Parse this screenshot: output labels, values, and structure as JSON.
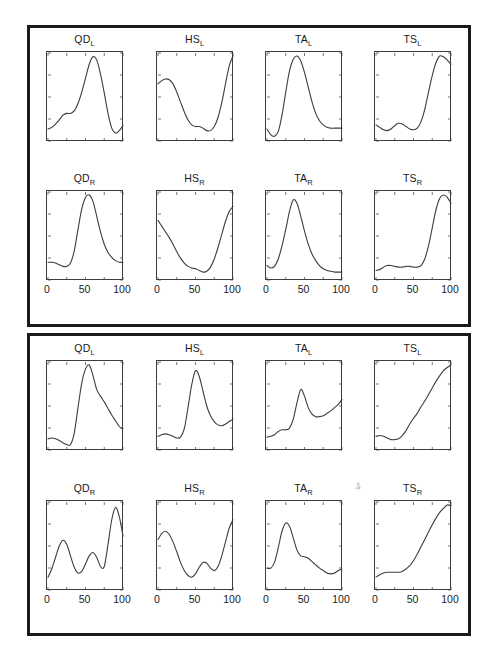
{
  "figure": {
    "background_color": "#ffffff",
    "border_color": "#1a1a1a",
    "curve_color": "#3d3d3d",
    "axis_color": "#3d3d3d",
    "width": 497,
    "height": 665,
    "panel_count": 2,
    "artifact_mark": "4"
  },
  "axis": {
    "x_ticks": [
      "0",
      "50",
      "100"
    ],
    "x_tick_values": [
      0,
      50,
      100
    ],
    "xlim": [
      0,
      100
    ],
    "ylim": [
      0,
      1
    ],
    "grid": false,
    "y_ticks_visible": false
  },
  "chart_data": [
    {
      "type": "line",
      "panel": 1,
      "row": 1,
      "col": 1,
      "title": "QD",
      "subscript": "L",
      "xlabel": "",
      "ylabel": "",
      "xlim": [
        0,
        100
      ],
      "ylim": [
        0,
        1
      ],
      "x": [
        0,
        5,
        10,
        15,
        20,
        25,
        30,
        35,
        40,
        45,
        50,
        55,
        60,
        65,
        70,
        75,
        80,
        85,
        90,
        95,
        100
      ],
      "y": [
        0.11,
        0.13,
        0.17,
        0.22,
        0.28,
        0.3,
        0.3,
        0.33,
        0.42,
        0.56,
        0.73,
        0.9,
        0.99,
        0.95,
        0.78,
        0.55,
        0.3,
        0.12,
        0.06,
        0.09,
        0.15
      ]
    },
    {
      "type": "line",
      "panel": 1,
      "row": 1,
      "col": 2,
      "title": "HS",
      "subscript": "L",
      "xlabel": "",
      "ylabel": "",
      "xlim": [
        0,
        100
      ],
      "ylim": [
        0,
        1
      ],
      "x": [
        0,
        5,
        10,
        15,
        20,
        25,
        30,
        35,
        40,
        45,
        50,
        55,
        60,
        65,
        70,
        75,
        80,
        85,
        90,
        95,
        100
      ],
      "y": [
        0.66,
        0.7,
        0.72,
        0.71,
        0.66,
        0.56,
        0.44,
        0.32,
        0.22,
        0.16,
        0.14,
        0.14,
        0.12,
        0.09,
        0.09,
        0.14,
        0.25,
        0.43,
        0.66,
        0.88,
        1.0
      ]
    },
    {
      "type": "line",
      "panel": 1,
      "row": 1,
      "col": 3,
      "title": "TA",
      "subscript": "L",
      "xlabel": "",
      "ylabel": "",
      "xlim": [
        0,
        100
      ],
      "ylim": [
        0,
        1
      ],
      "x": [
        0,
        5,
        10,
        15,
        20,
        25,
        30,
        35,
        40,
        45,
        50,
        55,
        60,
        65,
        70,
        75,
        80,
        85,
        90,
        95,
        100
      ],
      "y": [
        0.11,
        0.04,
        0.02,
        0.08,
        0.28,
        0.56,
        0.82,
        0.96,
        1.0,
        0.94,
        0.8,
        0.62,
        0.44,
        0.3,
        0.21,
        0.16,
        0.13,
        0.12,
        0.12,
        0.12,
        0.12
      ]
    },
    {
      "type": "line",
      "panel": 1,
      "row": 1,
      "col": 4,
      "title": "TS",
      "subscript": "L",
      "xlabel": "",
      "ylabel": "",
      "xlim": [
        0,
        100
      ],
      "ylim": [
        0,
        1
      ],
      "x": [
        0,
        5,
        10,
        15,
        20,
        25,
        30,
        35,
        40,
        45,
        50,
        55,
        60,
        65,
        70,
        75,
        80,
        85,
        90,
        95,
        100
      ],
      "y": [
        0.16,
        0.13,
        0.1,
        0.09,
        0.11,
        0.15,
        0.18,
        0.17,
        0.14,
        0.11,
        0.1,
        0.12,
        0.2,
        0.35,
        0.56,
        0.76,
        0.92,
        1.0,
        0.99,
        0.95,
        0.9
      ]
    },
    {
      "type": "line",
      "panel": 1,
      "row": 2,
      "col": 1,
      "title": "QD",
      "subscript": "R",
      "xlabel": "",
      "ylabel": "",
      "xlim": [
        0,
        100
      ],
      "ylim": [
        0,
        1
      ],
      "x": [
        0,
        5,
        10,
        15,
        20,
        25,
        30,
        35,
        40,
        45,
        50,
        55,
        60,
        65,
        70,
        75,
        80,
        85,
        90,
        95,
        100
      ],
      "y": [
        0.18,
        0.18,
        0.17,
        0.15,
        0.13,
        0.13,
        0.17,
        0.32,
        0.58,
        0.83,
        0.97,
        1.0,
        0.92,
        0.74,
        0.55,
        0.4,
        0.3,
        0.24,
        0.2,
        0.18,
        0.18
      ]
    },
    {
      "type": "line",
      "panel": 1,
      "row": 2,
      "col": 2,
      "title": "HS",
      "subscript": "R",
      "xlabel": "",
      "ylabel": "",
      "xlim": [
        0,
        100
      ],
      "ylim": [
        0,
        1
      ],
      "x": [
        0,
        5,
        10,
        15,
        20,
        25,
        30,
        35,
        40,
        45,
        50,
        55,
        60,
        65,
        70,
        75,
        80,
        85,
        90,
        95,
        100
      ],
      "y": [
        0.69,
        0.62,
        0.55,
        0.48,
        0.4,
        0.31,
        0.23,
        0.17,
        0.13,
        0.11,
        0.1,
        0.08,
        0.06,
        0.07,
        0.12,
        0.22,
        0.36,
        0.52,
        0.68,
        0.8,
        0.86
      ]
    },
    {
      "type": "line",
      "panel": 1,
      "row": 2,
      "col": 3,
      "title": "TA",
      "subscript": "R",
      "xlabel": "",
      "ylabel": "",
      "xlim": [
        0,
        100
      ],
      "ylim": [
        0,
        1
      ],
      "x": [
        0,
        5,
        10,
        15,
        20,
        25,
        30,
        35,
        40,
        45,
        50,
        55,
        60,
        65,
        70,
        75,
        80,
        85,
        90,
        95,
        100
      ],
      "y": [
        0.14,
        0.11,
        0.13,
        0.22,
        0.38,
        0.58,
        0.8,
        0.94,
        0.9,
        0.74,
        0.56,
        0.4,
        0.28,
        0.2,
        0.14,
        0.1,
        0.08,
        0.07,
        0.06,
        0.06,
        0.06
      ]
    },
    {
      "type": "line",
      "panel": 1,
      "row": 2,
      "col": 4,
      "title": "TS",
      "subscript": "R",
      "xlabel": "",
      "ylabel": "",
      "xlim": [
        0,
        100
      ],
      "ylim": [
        0,
        1
      ],
      "x": [
        0,
        5,
        10,
        15,
        20,
        25,
        30,
        35,
        40,
        45,
        50,
        55,
        60,
        65,
        70,
        75,
        80,
        85,
        90,
        95,
        100
      ],
      "y": [
        0.08,
        0.09,
        0.12,
        0.14,
        0.14,
        0.13,
        0.12,
        0.12,
        0.13,
        0.13,
        0.12,
        0.12,
        0.14,
        0.22,
        0.38,
        0.6,
        0.82,
        0.96,
        1.0,
        0.97,
        0.9
      ]
    },
    {
      "type": "line",
      "panel": 2,
      "row": 1,
      "col": 1,
      "title": "QD",
      "subscript": "L",
      "xlabel": "",
      "ylabel": "",
      "xlim": [
        0,
        100
      ],
      "ylim": [
        0,
        1
      ],
      "x": [
        0,
        5,
        10,
        15,
        20,
        25,
        30,
        35,
        40,
        45,
        50,
        55,
        60,
        65,
        70,
        75,
        80,
        85,
        90,
        95,
        100
      ],
      "y": [
        0.1,
        0.11,
        0.1,
        0.08,
        0.05,
        0.03,
        0.03,
        0.17,
        0.48,
        0.78,
        0.95,
        1.0,
        0.87,
        0.7,
        0.62,
        0.55,
        0.47,
        0.39,
        0.32,
        0.25,
        0.22
      ]
    },
    {
      "type": "line",
      "panel": 2,
      "row": 1,
      "col": 2,
      "title": "HS",
      "subscript": "L",
      "xlabel": "",
      "ylabel": "",
      "xlim": [
        0,
        100
      ],
      "ylim": [
        0,
        1
      ],
      "x": [
        0,
        5,
        10,
        15,
        20,
        25,
        30,
        35,
        40,
        45,
        50,
        55,
        60,
        65,
        70,
        75,
        80,
        85,
        90,
        95,
        100
      ],
      "y": [
        0.13,
        0.15,
        0.16,
        0.15,
        0.13,
        0.11,
        0.12,
        0.22,
        0.48,
        0.76,
        0.93,
        0.86,
        0.68,
        0.5,
        0.38,
        0.31,
        0.27,
        0.26,
        0.28,
        0.31,
        0.34
      ]
    },
    {
      "type": "line",
      "panel": 2,
      "row": 1,
      "col": 3,
      "title": "TA",
      "subscript": "L",
      "xlabel": "",
      "ylabel": "",
      "xlim": [
        0,
        100
      ],
      "ylim": [
        0,
        1
      ],
      "x": [
        0,
        5,
        10,
        15,
        20,
        25,
        30,
        35,
        40,
        45,
        50,
        55,
        60,
        65,
        70,
        75,
        80,
        85,
        90,
        95,
        100
      ],
      "y": [
        0.12,
        0.13,
        0.15,
        0.19,
        0.21,
        0.21,
        0.23,
        0.34,
        0.54,
        0.7,
        0.62,
        0.48,
        0.4,
        0.37,
        0.37,
        0.38,
        0.41,
        0.44,
        0.48,
        0.52,
        0.58
      ]
    },
    {
      "type": "line",
      "panel": 2,
      "row": 1,
      "col": 4,
      "title": "TS",
      "subscript": "L",
      "xlabel": "",
      "ylabel": "",
      "xlim": [
        0,
        100
      ],
      "ylim": [
        0,
        1
      ],
      "x": [
        0,
        5,
        10,
        15,
        20,
        25,
        30,
        35,
        40,
        45,
        50,
        55,
        60,
        65,
        70,
        75,
        80,
        85,
        90,
        95,
        100
      ],
      "y": [
        0.13,
        0.14,
        0.13,
        0.11,
        0.09,
        0.09,
        0.1,
        0.14,
        0.2,
        0.28,
        0.35,
        0.41,
        0.49,
        0.56,
        0.64,
        0.72,
        0.8,
        0.87,
        0.93,
        0.97,
        1.0
      ]
    },
    {
      "type": "line",
      "panel": 2,
      "row": 2,
      "col": 1,
      "title": "QD",
      "subscript": "R",
      "xlabel": "",
      "ylabel": "",
      "xlim": [
        0,
        100
      ],
      "ylim": [
        0,
        1
      ],
      "x": [
        0,
        5,
        10,
        15,
        20,
        25,
        30,
        35,
        40,
        45,
        50,
        55,
        60,
        65,
        70,
        75,
        80,
        85,
        90,
        95,
        100
      ],
      "y": [
        0.12,
        0.22,
        0.36,
        0.5,
        0.57,
        0.52,
        0.38,
        0.24,
        0.17,
        0.19,
        0.28,
        0.38,
        0.42,
        0.36,
        0.25,
        0.25,
        0.52,
        0.82,
        0.97,
        0.86,
        0.62
      ]
    },
    {
      "type": "line",
      "panel": 2,
      "row": 2,
      "col": 2,
      "title": "HS",
      "subscript": "R",
      "xlabel": "",
      "ylabel": "",
      "xlim": [
        0,
        100
      ],
      "ylim": [
        0,
        1
      ],
      "x": [
        0,
        5,
        10,
        15,
        20,
        25,
        30,
        35,
        40,
        45,
        50,
        55,
        60,
        65,
        70,
        75,
        80,
        85,
        90,
        95,
        100
      ],
      "y": [
        0.58,
        0.65,
        0.68,
        0.64,
        0.55,
        0.43,
        0.3,
        0.2,
        0.14,
        0.12,
        0.16,
        0.24,
        0.3,
        0.29,
        0.23,
        0.2,
        0.25,
        0.38,
        0.55,
        0.72,
        0.82
      ]
    },
    {
      "type": "line",
      "panel": 2,
      "row": 2,
      "col": 3,
      "title": "TA",
      "subscript": "R",
      "xlabel": "",
      "ylabel": "",
      "xlim": [
        0,
        100
      ],
      "ylim": [
        0,
        1
      ],
      "x": [
        0,
        5,
        10,
        15,
        20,
        25,
        30,
        35,
        40,
        45,
        50,
        55,
        60,
        65,
        70,
        75,
        80,
        85,
        90,
        95,
        100
      ],
      "y": [
        0.23,
        0.23,
        0.3,
        0.48,
        0.68,
        0.78,
        0.74,
        0.6,
        0.45,
        0.38,
        0.37,
        0.35,
        0.31,
        0.27,
        0.23,
        0.2,
        0.17,
        0.16,
        0.17,
        0.2,
        0.22
      ]
    },
    {
      "type": "line",
      "panel": 2,
      "row": 2,
      "col": 4,
      "title": "TS",
      "subscript": "R",
      "xlabel": "",
      "ylabel": "",
      "xlim": [
        0,
        100
      ],
      "ylim": [
        0,
        1
      ],
      "x": [
        0,
        5,
        10,
        15,
        20,
        25,
        30,
        35,
        40,
        45,
        50,
        55,
        60,
        65,
        70,
        75,
        80,
        85,
        90,
        95,
        100
      ],
      "y": [
        0.12,
        0.15,
        0.17,
        0.18,
        0.18,
        0.18,
        0.18,
        0.19,
        0.22,
        0.26,
        0.32,
        0.4,
        0.49,
        0.58,
        0.67,
        0.76,
        0.84,
        0.91,
        0.96,
        1.0,
        0.99
      ]
    }
  ]
}
